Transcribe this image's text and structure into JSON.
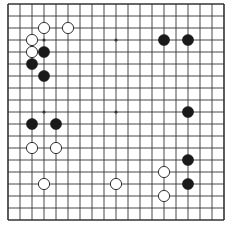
{
  "game": "go",
  "board_size": 19,
  "colors": {
    "background": "#ffffff",
    "line": "#333333",
    "black_stone": "#1a1a1a",
    "white_stone": "#ffffff",
    "white_stone_outline": "#333333"
  },
  "star_points": [
    [
      3,
      3
    ],
    [
      9,
      3
    ],
    [
      15,
      3
    ],
    [
      3,
      9
    ],
    [
      9,
      9
    ],
    [
      15,
      9
    ],
    [
      3,
      15
    ],
    [
      9,
      15
    ],
    [
      15,
      15
    ]
  ],
  "stones": [
    {
      "color": "white",
      "col": 3,
      "row": 2
    },
    {
      "color": "white",
      "col": 5,
      "row": 2
    },
    {
      "color": "white",
      "col": 2,
      "row": 3
    },
    {
      "color": "white",
      "col": 2,
      "row": 4
    },
    {
      "color": "black",
      "col": 3,
      "row": 4
    },
    {
      "color": "black",
      "col": 2,
      "row": 5
    },
    {
      "color": "black",
      "col": 3,
      "row": 6
    },
    {
      "color": "black",
      "col": 13,
      "row": 3
    },
    {
      "color": "black",
      "col": 15,
      "row": 3
    },
    {
      "color": "black",
      "col": 2,
      "row": 10
    },
    {
      "color": "black",
      "col": 4,
      "row": 10
    },
    {
      "color": "white",
      "col": 2,
      "row": 12
    },
    {
      "color": "white",
      "col": 4,
      "row": 12
    },
    {
      "color": "black",
      "col": 15,
      "row": 9
    },
    {
      "color": "black",
      "col": 15,
      "row": 13
    },
    {
      "color": "white",
      "col": 13,
      "row": 14
    },
    {
      "color": "black",
      "col": 15,
      "row": 15
    },
    {
      "color": "white",
      "col": 13,
      "row": 16
    },
    {
      "color": "white",
      "col": 3,
      "row": 15
    },
    {
      "color": "white",
      "col": 9,
      "row": 15
    }
  ]
}
